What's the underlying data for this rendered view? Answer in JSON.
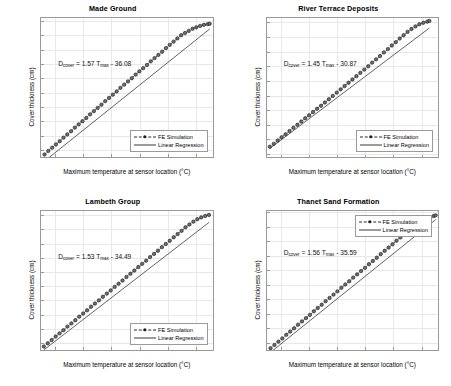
{
  "figure": {
    "layout": "2x2 subplot grid",
    "shared_xlabel": "Maximum temperature at sensor location (°C)",
    "shared_ylabel": "Cover thickness (cm)",
    "legend_entries": [
      "FE Simulation",
      "Linear Regression"
    ]
  },
  "chart_data": [
    {
      "type": "scatter",
      "title": "Made Ground",
      "xlabel": "Maximum temperature at sensor location (°C)",
      "ylabel": "Cover thickness (cm)",
      "xlim": [
        23.0,
        35.2
      ],
      "ylim": [
        1.0,
        20.4
      ],
      "xticks": [
        24,
        26,
        28,
        30,
        32,
        34
      ],
      "yticks": [
        2,
        4,
        6,
        8,
        10,
        12,
        14,
        16,
        18,
        20
      ],
      "grid": true,
      "legend_position": "lower right",
      "annotation": "D_cover = 1.57 T_max - 36.08",
      "equation": {
        "lhs": "D",
        "lhs_sub": "cover",
        "slope": 1.57,
        "var": "T",
        "var_sub": "max",
        "intercept": -36.08,
        "intercept_text": "36.08",
        "sign": "-"
      },
      "series": [
        {
          "name": "FE Simulation",
          "style": "dotted-with-circle-markers",
          "color": "#1c1c1c",
          "x": [
            23.25,
            23.52,
            23.79,
            24.06,
            24.33,
            24.6,
            24.87,
            25.14,
            25.41,
            25.68,
            25.95,
            26.22,
            26.49,
            26.76,
            27.03,
            27.3,
            27.57,
            27.84,
            28.11,
            28.38,
            28.65,
            28.92,
            29.19,
            29.46,
            29.73,
            30.0,
            30.27,
            30.54,
            30.81,
            31.08,
            31.35,
            31.62,
            31.89,
            32.16,
            32.43,
            32.7,
            32.97,
            33.24,
            33.51,
            33.78,
            34.05,
            34.32,
            34.59,
            34.86,
            35.0
          ],
          "y": [
            1.35,
            1.85,
            2.3,
            2.75,
            3.2,
            3.7,
            4.15,
            4.6,
            5.1,
            5.55,
            6.0,
            6.45,
            6.95,
            7.4,
            7.85,
            8.3,
            8.8,
            9.25,
            9.7,
            10.15,
            10.65,
            11.1,
            11.55,
            12.0,
            12.5,
            12.95,
            13.4,
            13.85,
            14.35,
            14.8,
            15.25,
            15.7,
            16.2,
            16.65,
            17.1,
            17.55,
            18.0,
            18.3,
            18.6,
            18.9,
            19.1,
            19.3,
            19.45,
            19.55,
            19.6
          ]
        },
        {
          "name": "Linear Regression",
          "style": "solid-line",
          "color": "#3a3a3a",
          "x": [
            23.25,
            35.0
          ],
          "y": [
            0.42,
            18.87
          ]
        }
      ]
    },
    {
      "type": "scatter",
      "title": "River Terrace Deposits",
      "xlabel": "Maximum temperature at sensor location (°C)",
      "ylabel": "Cover thickness (cm)",
      "xlim": [
        23.0,
        35.2
      ],
      "ylim": [
        1.6,
        20.6
      ],
      "xticks": [
        24,
        26,
        28,
        30,
        32,
        34
      ],
      "yticks": [
        2,
        4,
        6,
        8,
        10,
        12,
        14,
        16,
        18,
        20
      ],
      "grid": true,
      "legend_position": "lower right",
      "annotation": "D_cover = 1.45 T_max - 30.87",
      "equation": {
        "lhs": "D",
        "lhs_sub": "cover",
        "slope": 1.45,
        "var": "T",
        "var_sub": "max",
        "intercept": -30.87,
        "intercept_text": "30.87",
        "sign": "-"
      },
      "series": [
        {
          "name": "FE Simulation",
          "style": "dotted-with-circle-markers",
          "color": "#1c1c1c",
          "x": [
            23.2,
            23.48,
            23.76,
            24.04,
            24.32,
            24.6,
            24.88,
            25.16,
            25.44,
            25.72,
            26.0,
            26.28,
            26.56,
            26.84,
            27.12,
            27.4,
            27.68,
            27.96,
            28.24,
            28.52,
            28.8,
            29.08,
            29.36,
            29.64,
            29.92,
            30.2,
            30.48,
            30.76,
            31.04,
            31.32,
            31.6,
            31.88,
            32.16,
            32.44,
            32.72,
            33.0,
            33.28,
            33.56,
            33.84,
            34.12,
            34.4,
            34.55
          ],
          "y": [
            3.0,
            3.4,
            3.85,
            4.3,
            4.7,
            5.15,
            5.6,
            6.0,
            6.45,
            6.9,
            7.3,
            7.75,
            8.2,
            8.6,
            9.05,
            9.5,
            9.95,
            10.4,
            10.85,
            11.3,
            11.75,
            12.2,
            12.65,
            13.1,
            13.55,
            14.0,
            14.5,
            14.95,
            15.4,
            15.9,
            16.35,
            16.85,
            17.3,
            17.8,
            18.25,
            18.7,
            19.1,
            19.45,
            19.75,
            19.95,
            20.1,
            20.2
          ]
        },
        {
          "name": "Linear Regression",
          "style": "solid-line",
          "color": "#3a3a3a",
          "x": [
            23.2,
            34.55
          ],
          "y": [
            2.77,
            19.23
          ]
        }
      ]
    },
    {
      "type": "scatter",
      "title": "Lambeth Group",
      "xlabel": "Maximum temperature at sensor location (°C)",
      "ylabel": "Cover thickness (cm)",
      "xlim": [
        23.0,
        35.2
      ],
      "ylim": [
        1.0,
        20.6
      ],
      "xticks": [
        24,
        26,
        28,
        30,
        32,
        34
      ],
      "yticks": [
        2,
        4,
        6,
        8,
        10,
        12,
        14,
        16,
        18,
        20
      ],
      "grid": true,
      "legend_position": "lower right",
      "annotation": "D_cover = 1.53 T_max - 34.49",
      "equation": {
        "lhs": "D",
        "lhs_sub": "cover",
        "slope": 1.53,
        "var": "T",
        "var_sub": "max",
        "intercept": -34.49,
        "intercept_text": "34.49",
        "sign": "-"
      },
      "series": [
        {
          "name": "FE Simulation",
          "style": "dotted-with-circle-markers",
          "color": "#1c1c1c",
          "x": [
            23.2,
            23.48,
            23.76,
            24.04,
            24.32,
            24.6,
            24.88,
            25.16,
            25.44,
            25.72,
            26.0,
            26.28,
            26.56,
            26.84,
            27.12,
            27.4,
            27.68,
            27.96,
            28.24,
            28.52,
            28.8,
            29.08,
            29.36,
            29.64,
            29.92,
            30.2,
            30.48,
            30.76,
            31.04,
            31.32,
            31.6,
            31.88,
            32.16,
            32.44,
            32.72,
            33.0,
            33.28,
            33.56,
            33.84,
            34.12,
            34.4,
            34.68,
            34.95
          ],
          "y": [
            1.5,
            1.95,
            2.4,
            2.9,
            3.35,
            3.8,
            4.3,
            4.75,
            5.2,
            5.7,
            6.15,
            6.6,
            7.1,
            7.55,
            8.0,
            8.5,
            8.95,
            9.4,
            9.9,
            10.35,
            10.8,
            11.3,
            11.75,
            12.2,
            12.7,
            13.15,
            13.6,
            14.1,
            14.55,
            15.0,
            15.5,
            15.95,
            16.4,
            16.9,
            17.35,
            17.8,
            18.3,
            18.7,
            19.1,
            19.45,
            19.7,
            19.9,
            20.05
          ]
        },
        {
          "name": "Linear Regression",
          "style": "solid-line",
          "color": "#3a3a3a",
          "x": [
            23.2,
            34.95
          ],
          "y": [
            1.01,
            18.99
          ]
        }
      ]
    },
    {
      "type": "scatter",
      "title": "Thanet Sand Formation",
      "xlabel": "Maximum temperature at sensor location (°C)",
      "ylabel": "Cover thickness (cm)",
      "xlim": [
        23.0,
        35.2
      ],
      "ylim": [
        1.0,
        20.2
      ],
      "xticks": [
        24,
        26,
        28,
        30,
        32,
        34
      ],
      "yticks": [
        2,
        4,
        6,
        8,
        10,
        12,
        14,
        16,
        18,
        20
      ],
      "grid": true,
      "legend_position": "upper right",
      "annotation": "D_cover = 1.56 T_max - 35.59",
      "equation": {
        "lhs": "D",
        "lhs_sub": "cover",
        "slope": 1.56,
        "var": "T",
        "var_sub": "max",
        "intercept": -35.59,
        "intercept_text": "35.59",
        "sign": "-"
      },
      "series": [
        {
          "name": "FE Simulation",
          "style": "dotted-with-circle-markers",
          "color": "#1c1c1c",
          "x": [
            23.25,
            23.53,
            23.81,
            24.09,
            24.37,
            24.65,
            24.93,
            25.21,
            25.49,
            25.77,
            26.05,
            26.33,
            26.61,
            26.89,
            27.17,
            27.45,
            27.73,
            28.01,
            28.29,
            28.57,
            28.85,
            29.13,
            29.41,
            29.69,
            29.97,
            30.25,
            30.53,
            30.81,
            31.09,
            31.37,
            31.65,
            31.93,
            32.21,
            32.49,
            32.77,
            33.05,
            33.33,
            33.61,
            34.85,
            35.0
          ],
          "y": [
            1.25,
            1.7,
            2.15,
            2.6,
            3.1,
            3.55,
            4.0,
            4.5,
            4.95,
            5.4,
            5.85,
            6.35,
            6.8,
            7.25,
            7.75,
            8.2,
            8.65,
            9.1,
            9.6,
            10.05,
            10.5,
            11.0,
            11.45,
            11.9,
            12.35,
            12.85,
            13.3,
            13.75,
            14.25,
            14.7,
            15.15,
            15.6,
            16.1,
            16.55,
            17.0,
            17.45,
            17.9,
            18.35,
            19.5,
            19.6
          ]
        },
        {
          "name": "Linear Regression",
          "style": "solid-line",
          "color": "#3a3a3a",
          "x": [
            23.25,
            35.0
          ],
          "y": [
            0.68,
            19.01
          ]
        }
      ]
    }
  ]
}
